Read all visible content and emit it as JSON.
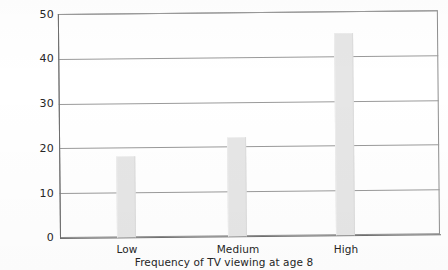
{
  "chart_data": {
    "type": "bar",
    "title": "",
    "subtitle": "",
    "xlabel": "Frequency of TV viewing at age 8",
    "ylabel": "",
    "categories": [
      "Low",
      "Medium",
      "High"
    ],
    "values": [
      18,
      22,
      45
    ],
    "series": [
      {
        "name": "",
        "values": [
          18,
          22,
          45
        ]
      }
    ],
    "ylim": [
      0,
      50
    ],
    "yticks": [
      0,
      10,
      20,
      30,
      40,
      50
    ],
    "ytick_labels": [
      "0",
      "10",
      "20",
      "30",
      "40",
      "50"
    ],
    "grid": true,
    "grid_axis": "y",
    "legend": false,
    "legend_position": "none",
    "bar_color": "#e6e6e6",
    "axis_color": "#6e6e6e",
    "grid_color": "#9a9a9a",
    "text_color": "#262626",
    "background": "#ffffff",
    "annotations": []
  },
  "axis": {
    "y_tick_0": "0",
    "y_tick_1": "10",
    "y_tick_2": "20",
    "y_tick_3": "30",
    "y_tick_4": "40",
    "y_tick_5": "50",
    "x_tick_0": "Low",
    "x_tick_1": "Medium",
    "x_tick_2": "High",
    "x_axis_title": "Frequency of TV viewing at age 8"
  }
}
